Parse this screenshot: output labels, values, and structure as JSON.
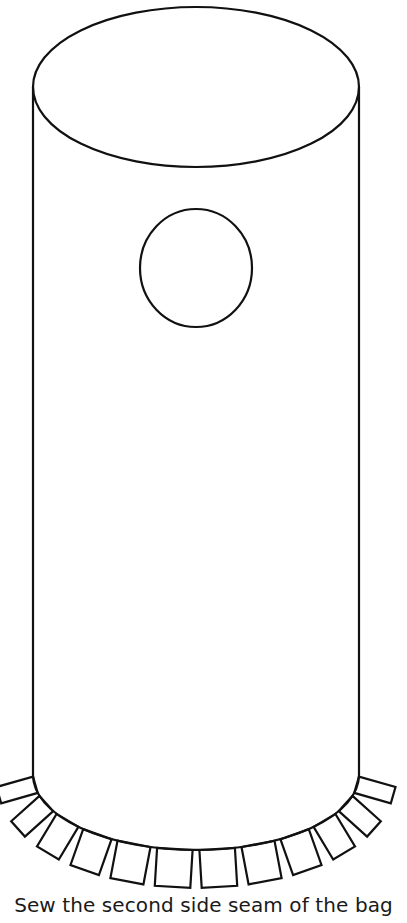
{
  "figure": {
    "stroke_color": "#111111",
    "background_color": "#ffffff",
    "parts": {
      "top_opening": "ellipse",
      "body": "cylinder",
      "hole": "circle",
      "bottom_tabs_count": 12
    }
  },
  "caption": {
    "text": "Sew the second side seam of the bag"
  }
}
